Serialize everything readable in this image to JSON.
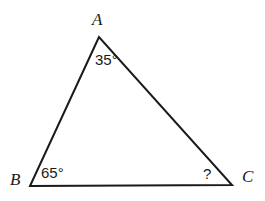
{
  "figure": {
    "type": "geometry-triangle-diagram",
    "background_color": "#ffffff",
    "stroke_color": "#1a1a1a",
    "text_color": "#1a1a1a",
    "vertices": [
      {
        "name": "A",
        "label": "A",
        "x": 99,
        "y": 37
      },
      {
        "name": "B",
        "label": "B",
        "x": 30,
        "y": 186
      },
      {
        "name": "C",
        "label": "C",
        "x": 232,
        "y": 185
      }
    ],
    "angles": [
      {
        "at": "A",
        "label": "35°",
        "value": 35,
        "known": true
      },
      {
        "at": "B",
        "label": "65°",
        "value": 65,
        "known": true
      },
      {
        "at": "C",
        "label": "?",
        "value": null,
        "known": false
      }
    ],
    "sides": [
      {
        "from": "A",
        "to": "B"
      },
      {
        "from": "B",
        "to": "C"
      },
      {
        "from": "C",
        "to": "A"
      }
    ]
  }
}
